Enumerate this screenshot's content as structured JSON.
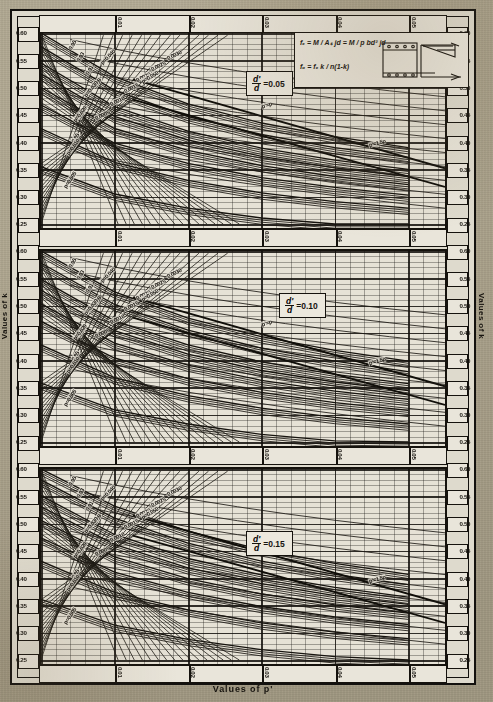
{
  "figure": {
    "x_axis_title": "Values of p'",
    "y_axis_title_left": "Values of k",
    "y_axis_title_right": "Values of k",
    "formula_1": "fₑ = M / Aₛ jd = M / p bd² jd",
    "formula_2": "fₒ = fₑ k / n(1-k)",
    "diagram_labels": {
      "top": "d'",
      "bars": "kd",
      "right1": "C'",
      "right2": "Cₙc",
      "depth": "d",
      "base": "bd"
    }
  },
  "panels": [
    {
      "id": "p1",
      "label_num": "d'",
      "label_den": "d",
      "label_eq": "=0.05"
    },
    {
      "id": "p2",
      "label_num": "d'",
      "label_den": "d",
      "label_eq": "=0.10"
    },
    {
      "id": "p3",
      "label_num": "d'",
      "label_den": "d",
      "label_eq": "=0.15"
    }
  ],
  "chart_data": {
    "type": "line",
    "title": "",
    "xlabel": "Values of p'",
    "ylabel": "Values of k",
    "xlim": [
      0.0,
      0.055
    ],
    "ylim": [
      0.25,
      0.6
    ],
    "grid": true,
    "legend_position": "in-plot curve labels",
    "x_ticks": [
      "0.01",
      "0.02",
      "0.03",
      "0.04",
      "0.05"
    ],
    "x_tick_values": [
      0.01,
      0.02,
      0.03,
      0.04,
      0.05
    ],
    "y_ticks": [
      "0.60",
      "0.55",
      "0.50",
      "0.45",
      "0.40",
      "0.35",
      "0.30",
      "0.25"
    ],
    "y_tick_values": [
      0.6,
      0.55,
      0.5,
      0.45,
      0.4,
      0.35,
      0.3,
      0.25
    ],
    "subplots": [
      {
        "name": "d'/d = 0.05",
        "series": [
          {
            "name": "p=0.050",
            "label": "p=0.050",
            "x": [
              0.0,
              0.01,
              0.02,
              0.03,
              0.04,
              0.05
            ],
            "values": [
              0.6,
              0.52,
              0.47,
              0.435,
              0.41,
              0.39
            ]
          },
          {
            "name": "p=0.040",
            "label": "p=0.040",
            "x": [
              0.0,
              0.01,
              0.02,
              0.03,
              0.04,
              0.05
            ],
            "values": [
              0.575,
              0.495,
              0.447,
              0.414,
              0.39,
              0.372
            ]
          },
          {
            "name": "p=0.030",
            "label": "p=0.030",
            "x": [
              0.0,
              0.01,
              0.02,
              0.03,
              0.04,
              0.05
            ],
            "values": [
              0.545,
              0.465,
              0.42,
              0.389,
              0.367,
              0.35
            ]
          },
          {
            "name": "p=0.025",
            "label": "p=0.025",
            "x": [
              0.0,
              0.01,
              0.02,
              0.03,
              0.04,
              0.05
            ],
            "values": [
              0.525,
              0.447,
              0.404,
              0.374,
              0.353,
              0.337
            ]
          },
          {
            "name": "p=0.020",
            "label": "p=0.020",
            "x": [
              0.0,
              0.01,
              0.02,
              0.03,
              0.04,
              0.05
            ],
            "values": [
              0.5,
              0.425,
              0.385,
              0.357,
              0.337,
              0.322
            ]
          },
          {
            "name": "p=0.015",
            "label": "p=0.015",
            "x": [
              0.0,
              0.01,
              0.02,
              0.03,
              0.04,
              0.05
            ],
            "values": [
              0.468,
              0.398,
              0.361,
              0.335,
              0.317,
              0.303
            ]
          },
          {
            "name": "p=0.010",
            "label": "p=0.010",
            "x": [
              0.0,
              0.01,
              0.02,
              0.03,
              0.04,
              0.05
            ],
            "values": [
              0.425,
              0.363,
              0.33,
              0.307,
              0.291,
              0.279
            ]
          },
          {
            "name": "p=0.005",
            "label": "p=0.005",
            "x": [
              0.0,
              0.01,
              0.02,
              0.03,
              0.04,
              0.05
            ],
            "values": [
              0.355,
              0.305,
              0.279,
              0.261,
              0.25,
              0.25
            ]
          },
          {
            "name": "p'=p",
            "label": "p'=p",
            "annotation": true
          },
          {
            "name": "p'=1.5p",
            "label": "p'=1.5p",
            "annotation": true
          }
        ],
        "pprime_labels": [
          "0.0030",
          "0.0025",
          "0.0020",
          "0.0015",
          "0.0010",
          "0.0005"
        ],
        "k_ratio_labels": [
          "0.95",
          "0.93",
          "0.91",
          "0.89",
          "0.87",
          "0.85"
        ]
      },
      {
        "name": "d'/d = 0.10",
        "series": [
          {
            "name": "p=0.050",
            "label": "p=0.050",
            "x": [
              0.0,
              0.01,
              0.02,
              0.03,
              0.04,
              0.05
            ],
            "values": [
              0.6,
              0.525,
              0.477,
              0.443,
              0.418,
              0.398
            ]
          },
          {
            "name": "p=0.040",
            "label": "p=0.040",
            "x": [
              0.0,
              0.01,
              0.02,
              0.03,
              0.04,
              0.05
            ],
            "values": [
              0.578,
              0.502,
              0.455,
              0.422,
              0.398,
              0.379
            ]
          },
          {
            "name": "p=0.030",
            "label": "p=0.030",
            "x": [
              0.0,
              0.01,
              0.02,
              0.03,
              0.04,
              0.05
            ],
            "values": [
              0.548,
              0.472,
              0.428,
              0.397,
              0.374,
              0.357
            ]
          },
          {
            "name": "p=0.025",
            "label": "p=0.025",
            "x": [
              0.0,
              0.01,
              0.02,
              0.03,
              0.04,
              0.05
            ],
            "values": [
              0.528,
              0.454,
              0.411,
              0.381,
              0.36,
              0.344
            ]
          },
          {
            "name": "p=0.020",
            "label": "p=0.020",
            "x": [
              0.0,
              0.01,
              0.02,
              0.03,
              0.04,
              0.05
            ],
            "values": [
              0.503,
              0.431,
              0.391,
              0.363,
              0.343,
              0.328
            ]
          },
          {
            "name": "p=0.015",
            "label": "p=0.015",
            "x": [
              0.0,
              0.01,
              0.02,
              0.03,
              0.04,
              0.05
            ],
            "values": [
              0.471,
              0.404,
              0.366,
              0.341,
              0.322,
              0.308
            ]
          },
          {
            "name": "p=0.010",
            "label": "p=0.010",
            "x": [
              0.0,
              0.01,
              0.02,
              0.03,
              0.04,
              0.05
            ],
            "values": [
              0.428,
              0.368,
              0.335,
              0.312,
              0.295,
              0.283
            ]
          },
          {
            "name": "p=0.005",
            "label": "p=0.005",
            "x": [
              0.0,
              0.01,
              0.02,
              0.03,
              0.04,
              0.05
            ],
            "values": [
              0.358,
              0.309,
              0.283,
              0.264,
              0.252,
              0.25
            ]
          },
          {
            "name": "p'=p",
            "label": "p'=p",
            "annotation": true
          },
          {
            "name": "p'=1.5p",
            "label": "p'=1.5p",
            "annotation": true
          }
        ],
        "pprime_labels": [
          "0.0030",
          "0.0025",
          "0.0020",
          "0.0015",
          "0.0010",
          "0.0005"
        ],
        "k_ratio_labels": [
          "0.95",
          "0.93",
          "0.91",
          "0.89",
          "0.87",
          "0.85"
        ]
      },
      {
        "name": "d'/d = 0.15",
        "series": [
          {
            "name": "p=0.050",
            "label": "p=0.050",
            "x": [
              0.0,
              0.01,
              0.02,
              0.03,
              0.04,
              0.05
            ],
            "values": [
              0.6,
              0.532,
              0.486,
              0.452,
              0.427,
              0.407
            ]
          },
          {
            "name": "p=0.040",
            "label": "p=0.040",
            "x": [
              0.0,
              0.01,
              0.02,
              0.03,
              0.04,
              0.05
            ],
            "values": [
              0.58,
              0.51,
              0.464,
              0.431,
              0.407,
              0.388
            ]
          },
          {
            "name": "p=0.030",
            "label": "p=0.030",
            "x": [
              0.0,
              0.01,
              0.02,
              0.03,
              0.04,
              0.05
            ],
            "values": [
              0.551,
              0.48,
              0.436,
              0.406,
              0.383,
              0.365
            ]
          },
          {
            "name": "p=0.025",
            "label": "p=0.025",
            "x": [
              0.0,
              0.01,
              0.02,
              0.03,
              0.04,
              0.05
            ],
            "values": [
              0.531,
              0.462,
              0.419,
              0.39,
              0.368,
              0.352
            ]
          },
          {
            "name": "p=0.020",
            "label": "p=0.020",
            "x": [
              0.0,
              0.01,
              0.02,
              0.03,
              0.04,
              0.05
            ],
            "values": [
              0.506,
              0.439,
              0.399,
              0.371,
              0.351,
              0.336
            ]
          },
          {
            "name": "p=0.015",
            "label": "p=0.015",
            "x": [
              0.0,
              0.01,
              0.02,
              0.03,
              0.04,
              0.05
            ],
            "values": [
              0.474,
              0.411,
              0.374,
              0.348,
              0.329,
              0.315
            ]
          },
          {
            "name": "p=0.010",
            "label": "p=0.010",
            "x": [
              0.0,
              0.01,
              0.02,
              0.03,
              0.04,
              0.05
            ],
            "values": [
              0.431,
              0.374,
              0.342,
              0.318,
              0.301,
              0.289
            ]
          },
          {
            "name": "p=0.005",
            "label": "p=0.005",
            "x": [
              0.0,
              0.01,
              0.02,
              0.03,
              0.04,
              0.05
            ],
            "values": [
              0.361,
              0.314,
              0.288,
              0.269,
              0.256,
              0.25
            ]
          },
          {
            "name": "p'=p",
            "label": "p'=p",
            "annotation": true
          },
          {
            "name": "p'=1.5p",
            "label": "p'=1.5p",
            "annotation": true
          }
        ],
        "pprime_labels": [
          "0.0030",
          "0.0025",
          "0.0020",
          "0.0015",
          "0.0010",
          "0.0005"
        ],
        "k_ratio_labels": [
          "0.95",
          "0.93",
          "0.91",
          "0.89",
          "0.87",
          "0.85"
        ]
      }
    ]
  },
  "colors": {
    "ink": "#16130e",
    "paper": "#dedacd",
    "page": "#cfcabb"
  }
}
